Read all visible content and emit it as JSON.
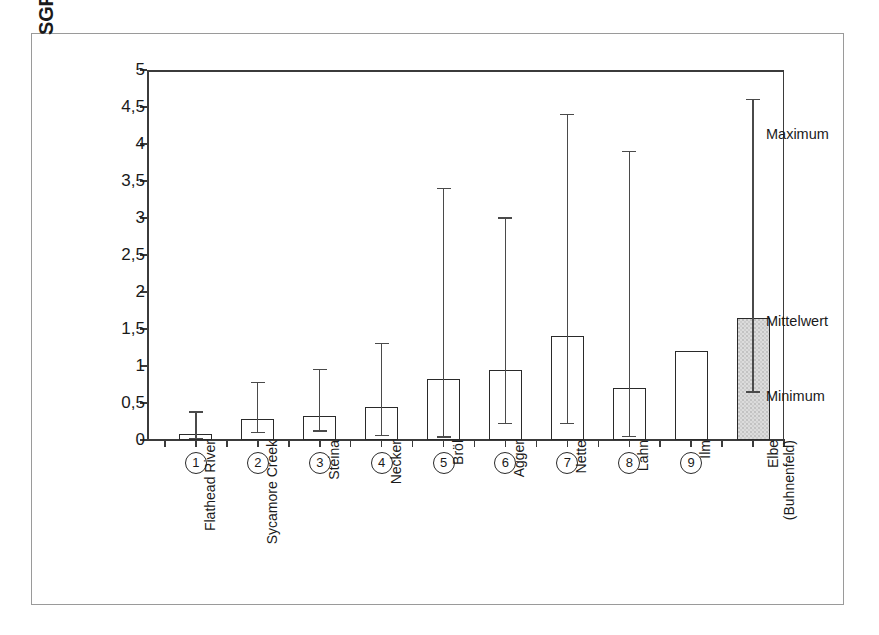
{
  "chart_data": {
    "type": "bar",
    "title": "",
    "subtitle": "",
    "xlabel": "",
    "ylabel": "SGR [mg/(dm³·h) O₂]",
    "ylim": [
      0,
      5
    ],
    "ytick_labels": [
      "0",
      "0,5",
      "1",
      "1,5",
      "2",
      "2,5",
      "3",
      "3,5",
      "4",
      "4,5",
      "5"
    ],
    "ytick_values": [
      0,
      0.5,
      1,
      1.5,
      2,
      2.5,
      3,
      3.5,
      4,
      4.5,
      5
    ],
    "grid": false,
    "legend_position": "right-outside-annotations",
    "error_bar_meaning": [
      "Maximum",
      "Mittelwert",
      "Minimum"
    ],
    "categories": [
      "Flathead River",
      "Sycamore Creek",
      "Steina",
      "Necker",
      "Bröl",
      "Agger",
      "Nette",
      "Lahn",
      "Ilm",
      "Elbe (Buhnenfeld)"
    ],
    "category_numbers": [
      "1",
      "2",
      "3",
      "4",
      "5",
      "6",
      "7",
      "8",
      "9",
      ""
    ],
    "series": [
      {
        "name": "Mittelwert",
        "values": [
          0.08,
          0.29,
          0.32,
          0.45,
          0.83,
          0.95,
          1.4,
          0.7,
          1.2,
          1.65
        ]
      },
      {
        "name": "Maximum",
        "values": [
          0.38,
          0.78,
          0.95,
          1.3,
          3.4,
          3.0,
          4.4,
          3.9,
          null,
          4.6
        ]
      },
      {
        "name": "Minimum",
        "values": [
          0.02,
          0.1,
          0.12,
          0.06,
          0.04,
          0.22,
          0.22,
          0.05,
          null,
          0.65
        ]
      }
    ],
    "highlighted_category": "Elbe (Buhnenfeld)",
    "colors": {
      "bar_edge": "#2a2a2a",
      "bar_fill": "transparent",
      "highlight_fill": "#dcdcdc",
      "axis": "#3b3b3b",
      "text": "#1a1a1a",
      "frame": "#9a9a9a"
    }
  },
  "annotations": {
    "maximum": "Maximum",
    "mittelwert": "Mittelwert",
    "minimum": "Minimum"
  }
}
